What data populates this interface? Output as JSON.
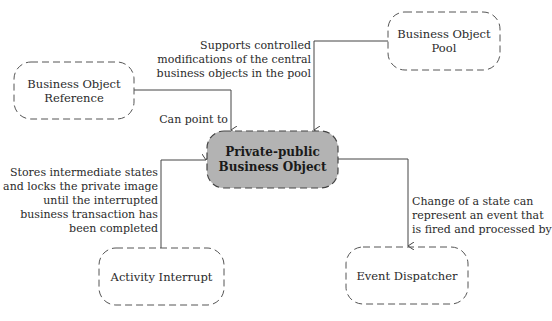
{
  "nodes": {
    "center": {
      "line1": "Private-public",
      "line2": "Business Object"
    },
    "pool": {
      "line1": "Business Object",
      "line2": "Pool"
    },
    "reference": {
      "line1": "Business Object",
      "line2": "Reference"
    },
    "interrupt": {
      "line1": "Activity Interrupt"
    },
    "dispatcher": {
      "line1": "Event Dispatcher"
    }
  },
  "edges": {
    "pool_label": [
      "Supports controlled",
      "modifications of the central",
      "business objects in the pool"
    ],
    "reference_label": [
      "Can point to"
    ],
    "interrupt_label": [
      "Stores intermediate states",
      "and locks the private image",
      "until the interrupted",
      "business transaction has",
      "been completed"
    ],
    "dispatcher_label": [
      "Change of a state can",
      "represent an event that",
      "is fired and processed by"
    ]
  },
  "colors": {
    "center_fill": "#b3b3b3",
    "stroke": "#555555",
    "line": "#444444"
  }
}
